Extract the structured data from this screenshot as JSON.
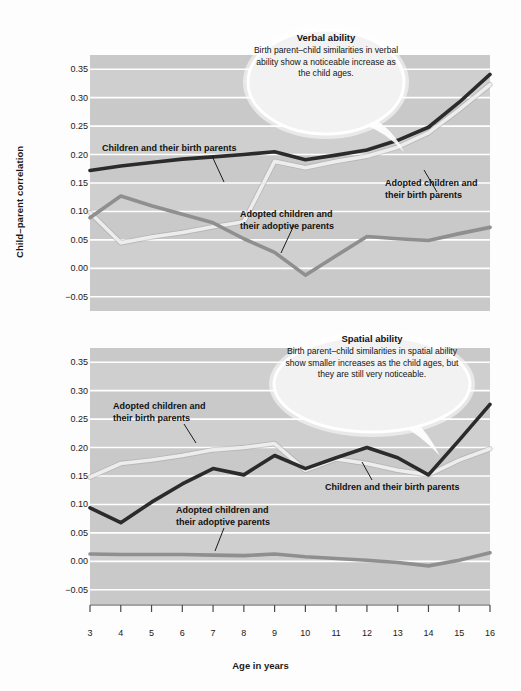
{
  "figure": {
    "background": "#fdfdfd",
    "panel_background": "#c9c9c9",
    "panel_background_alt": "#d4d4d4",
    "gridline_color": "#ffffff"
  },
  "axes": {
    "y_title": "Child–parent correlation",
    "x_title": "Age in years",
    "y_ticks": [
      "0.35",
      "0.30",
      "0.25",
      "0.20",
      "0.15",
      "0.10",
      "0.05",
      "0.00",
      "−0.05"
    ],
    "y_values": [
      0.35,
      0.3,
      0.25,
      0.2,
      0.15,
      0.1,
      0.05,
      0.0,
      -0.05
    ],
    "x_ticks": [
      "3",
      "4",
      "5",
      "6",
      "7",
      "8",
      "9",
      "10",
      "11",
      "12",
      "13",
      "14",
      "15",
      "16"
    ]
  },
  "colors": {
    "birth_parents": "#2b2b2b",
    "adoptive_parents": "#8f8f8f",
    "adopted_birth_parents": "#ededed",
    "text": "#141414"
  },
  "callouts": [
    {
      "id": "verbal-ability-callout",
      "title": "Verbal ability",
      "body": "Birth parent–child similarities in verbal ability show a noticeable increase as the child ages."
    },
    {
      "id": "spatial-ability-callout",
      "title": "Spatial ability",
      "body": "Birth parent–child similarities in spatial ability show smaller increases as the child ages, but they are still very noticeable."
    }
  ],
  "series_labels": {
    "top": [
      {
        "id": "label-top-birth",
        "text": "Children and their birth parents"
      },
      {
        "id": "label-top-adoptive",
        "text": "Adopted children and\ntheir adoptive parents"
      },
      {
        "id": "label-top-adopted-birth",
        "text": "Adopted children and\ntheir birth parents"
      }
    ],
    "bottom": [
      {
        "id": "label-bottom-adopted-birth",
        "text": "Adopted children and\ntheir birth parents"
      },
      {
        "id": "label-bottom-adoptive",
        "text": "Adopted children and\ntheir adoptive parents"
      },
      {
        "id": "label-bottom-birth",
        "text": "Children and their birth parents"
      }
    ]
  },
  "chart_data": [
    {
      "type": "line",
      "id": "verbal-ability-chart",
      "title": "Verbal ability",
      "xlabel": "Age in years",
      "ylabel": "Child–parent correlation",
      "x": [
        3,
        4,
        5,
        6,
        7,
        8,
        9,
        10,
        11,
        12,
        13,
        14,
        15,
        16
      ],
      "xlim": [
        3,
        16
      ],
      "ylim": [
        -0.075,
        0.375
      ],
      "grid": true,
      "legend": "inline-annotations",
      "series": [
        {
          "name": "Children and their birth parents",
          "color": "#2b2b2b",
          "values": [
            0.172,
            0.18,
            0.186,
            0.192,
            0.196,
            0.2,
            0.205,
            0.191,
            0.199,
            0.208,
            0.225,
            0.248,
            0.292,
            0.341
          ]
        },
        {
          "name": "Adopted children and their birth parents",
          "color": "#ededed",
          "values": [
            0.098,
            0.045,
            0.055,
            0.063,
            0.073,
            0.082,
            0.188,
            0.177,
            0.188,
            0.197,
            0.213,
            0.238,
            0.279,
            0.323
          ]
        },
        {
          "name": "Adopted children and their adoptive parents",
          "color": "#8f8f8f",
          "values": [
            0.089,
            0.127,
            0.11,
            0.095,
            0.08,
            0.052,
            0.028,
            -0.012,
            0.022,
            0.056,
            0.052,
            0.049,
            0.061,
            0.072
          ]
        }
      ]
    },
    {
      "type": "line",
      "id": "spatial-ability-chart",
      "title": "Spatial ability",
      "xlabel": "Age in years",
      "ylabel": "Child–parent correlation",
      "x": [
        3,
        4,
        5,
        6,
        7,
        8,
        9,
        10,
        11,
        12,
        13,
        14,
        15,
        16
      ],
      "xlim": [
        3,
        16
      ],
      "ylim": [
        -0.075,
        0.375
      ],
      "grid": true,
      "legend": "inline-annotations",
      "series": [
        {
          "name": "Children and their birth parents",
          "color": "#2b2b2b",
          "values": [
            0.094,
            0.068,
            0.104,
            0.136,
            0.163,
            0.152,
            0.186,
            0.163,
            0.182,
            0.2,
            0.182,
            0.152,
            0.213,
            0.276
          ]
        },
        {
          "name": "Adopted children and their birth parents",
          "color": "#ededed",
          "values": [
            0.148,
            0.172,
            0.178,
            0.186,
            0.196,
            0.2,
            0.207,
            0.16,
            0.18,
            0.172,
            0.16,
            0.152,
            0.178,
            0.198
          ]
        },
        {
          "name": "Adopted children and their adoptive parents",
          "color": "#8f8f8f",
          "values": [
            0.013,
            0.012,
            0.012,
            0.012,
            0.011,
            0.01,
            0.013,
            0.008,
            0.005,
            0.002,
            -0.002,
            -0.008,
            0.002,
            0.015
          ]
        }
      ]
    }
  ]
}
